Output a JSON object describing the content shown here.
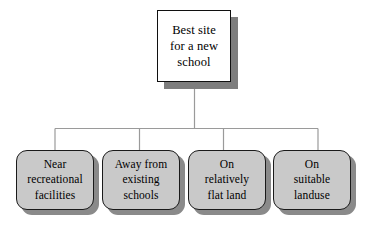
{
  "diagram": {
    "type": "hierarchy-tree",
    "orientation": "top-down",
    "background_color": "#ffffff",
    "root": {
      "id": "root",
      "label": "Best site for a new school",
      "lines": [
        "Best site",
        "for a new",
        "school"
      ],
      "shape": "rectangle",
      "fill_color": "#ffffff",
      "border_color": "#101010",
      "shadow_color": "#7d7d7d"
    },
    "children": [
      {
        "id": "child-1",
        "label": "Near recreational facilities",
        "lines": [
          "Near",
          "recreational",
          "facilities"
        ],
        "shape": "rounded-rectangle",
        "fill_color": "#c9c9c9",
        "border_color": "#1a1a1a",
        "shadow_color": "#8a8a8a"
      },
      {
        "id": "child-2",
        "label": "Away from existing schools",
        "lines": [
          "Away from",
          "existing",
          "schools"
        ],
        "shape": "rounded-rectangle",
        "fill_color": "#c9c9c9",
        "border_color": "#1a1a1a",
        "shadow_color": "#8a8a8a"
      },
      {
        "id": "child-3",
        "label": "On relatively flat land",
        "lines": [
          "On",
          "relatively",
          "flat land"
        ],
        "shape": "rounded-rectangle",
        "fill_color": "#c9c9c9",
        "border_color": "#1a1a1a",
        "shadow_color": "#8a8a8a"
      },
      {
        "id": "child-4",
        "label": "On suitable landuse",
        "lines": [
          "On",
          "suitable",
          "landuse"
        ],
        "shape": "rounded-rectangle",
        "fill_color": "#c9c9c9",
        "border_color": "#1a1a1a",
        "shadow_color": "#8a8a8a"
      }
    ],
    "connectors": {
      "line_color": "#9a9a9a",
      "style": "orthogonal-bus"
    }
  }
}
